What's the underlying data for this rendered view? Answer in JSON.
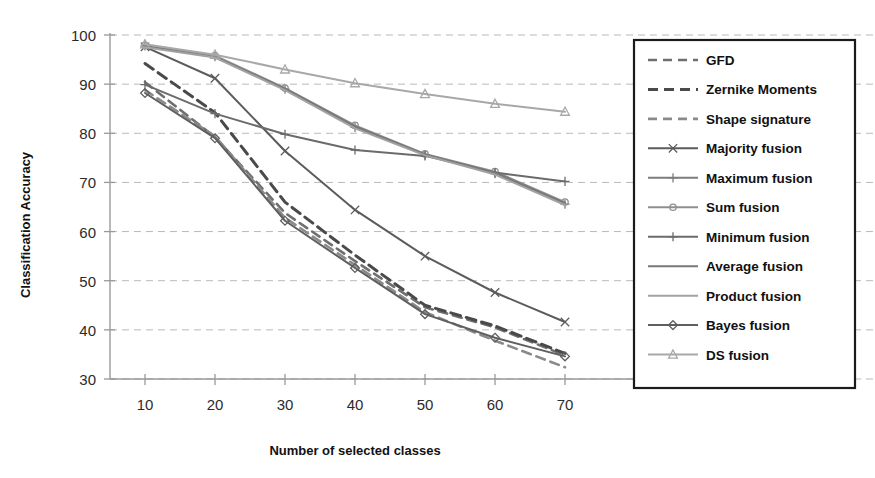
{
  "chart_data": {
    "type": "line",
    "title": "",
    "xlabel": "Number of selected classes",
    "ylabel": "Classification Accuracy",
    "x": [
      10,
      20,
      30,
      40,
      50,
      60,
      70
    ],
    "xlim": [
      5,
      75
    ],
    "ylim": [
      30,
      100
    ],
    "xticks": [
      "10",
      "20",
      "30",
      "40",
      "50",
      "60",
      "70"
    ],
    "yticks": [
      "100",
      "90",
      "80",
      "70",
      "60",
      "50",
      "40",
      "30"
    ],
    "grid": true,
    "legend_position": "right-outside",
    "series": [
      {
        "name": "GFD",
        "values": [
          90.4,
          79.2,
          63.8,
          54.0,
          44.6,
          40.5,
          34.8
        ],
        "color": "#6f6f6f",
        "dash": "9 6",
        "width": 2.6,
        "marker": "none"
      },
      {
        "name": "Zernike Moments",
        "values": [
          94.2,
          84.2,
          66.0,
          55.2,
          45.0,
          40.8,
          35.2
        ],
        "color": "#4a4a4a",
        "dash": "10 6",
        "width": 3.0,
        "marker": "none"
      },
      {
        "name": "Shape signature",
        "values": [
          88.8,
          79.4,
          62.8,
          53.2,
          43.6,
          37.8,
          32.4
        ],
        "color": "#8a8a8a",
        "dash": "9 6",
        "width": 2.6,
        "marker": "none"
      },
      {
        "name": "Majority fusion",
        "values": [
          97.6,
          91.2,
          76.4,
          64.4,
          55.0,
          47.6,
          41.6
        ],
        "color": "#5c5c5c",
        "dash": "none",
        "width": 2.0,
        "marker": "x"
      },
      {
        "name": "Maximum fusion",
        "values": [
          97.8,
          95.6,
          89.0,
          81.2,
          75.6,
          71.8,
          65.6
        ],
        "color": "#7d7d7d",
        "dash": "none",
        "width": 2.0,
        "marker": "plus"
      },
      {
        "name": "Sum fusion",
        "values": [
          97.9,
          95.8,
          89.2,
          81.6,
          75.8,
          72.2,
          66.0
        ],
        "color": "#8f8f8f",
        "dash": "none",
        "width": 2.0,
        "marker": "circle"
      },
      {
        "name": "Minimum fusion",
        "values": [
          89.9,
          84.0,
          79.8,
          76.6,
          75.4,
          72.0,
          70.2
        ],
        "color": "#6b6b6b",
        "dash": "none",
        "width": 2.0,
        "marker": "plus"
      },
      {
        "name": "Average fusion",
        "values": [
          97.7,
          95.5,
          89.1,
          81.4,
          75.7,
          72.0,
          65.8
        ],
        "color": "#787878",
        "dash": "none",
        "width": 2.0,
        "marker": "none"
      },
      {
        "name": "Product fusion",
        "values": [
          97.5,
          95.4,
          88.8,
          81.0,
          75.5,
          71.6,
          65.4
        ],
        "color": "#a2a2a2",
        "dash": "none",
        "width": 2.0,
        "marker": "none"
      },
      {
        "name": "Bayes fusion",
        "values": [
          88.2,
          79.0,
          62.2,
          52.6,
          43.2,
          38.4,
          34.6
        ],
        "color": "#5f5f5f",
        "dash": "none",
        "width": 2.0,
        "marker": "diamond"
      },
      {
        "name": "DS fusion",
        "values": [
          98.1,
          96.0,
          93.0,
          90.2,
          88.0,
          86.0,
          84.4
        ],
        "color": "#a8a8a8",
        "dash": "none",
        "width": 2.0,
        "marker": "triangle"
      }
    ]
  },
  "colors": {
    "background": "#ffffff",
    "grid": "#b9b9bd",
    "axis": "#9a9a9e",
    "text": "#111111",
    "legend_border": "#1b1b1b"
  }
}
